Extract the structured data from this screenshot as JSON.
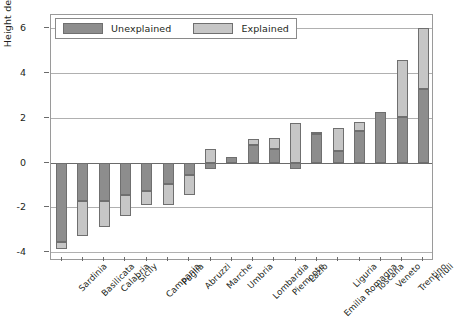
{
  "chart_data": {
    "type": "bar",
    "title": "",
    "xlabel": "",
    "ylabel": "Height deviation (cm)",
    "ylim": [
      -4.4,
      6.6
    ],
    "yticks": [
      6,
      4,
      2,
      0,
      -2,
      -4
    ],
    "ytick_labels": [
      "6",
      "4",
      "2",
      "0",
      "-2",
      "-4"
    ],
    "grid": true,
    "stacked": true,
    "legend_position": "top-left",
    "categories": [
      "Sardinia",
      "Basilicata",
      "Calabria",
      "Sicily",
      "Campania",
      "Puglia",
      "Abruzzi",
      "Marche",
      "Umbria",
      "Lombardia",
      "Piemonte",
      "Lazio",
      "Emilia Romagna",
      "Liguria",
      "Toscana",
      "Veneto",
      "Trentino",
      "Friuli"
    ],
    "series": [
      {
        "name": "Unexplained",
        "color": "#8d8d8d",
        "values": [
          -3.55,
          -1.7,
          -1.7,
          -1.45,
          -1.25,
          -0.95,
          -0.55,
          -0.3,
          0.25,
          0.8,
          0.6,
          -0.3,
          1.3,
          0.5,
          1.4,
          2.25,
          2.05,
          3.3
        ]
      },
      {
        "name": "Explained",
        "color": "#c6c6c6",
        "values": [
          -0.3,
          -1.6,
          -1.2,
          -0.95,
          -0.65,
          -0.95,
          -0.9,
          0.6,
          0.0,
          0.25,
          0.5,
          1.75,
          0.05,
          1.05,
          0.4,
          0.0,
          2.55,
          2.7
        ]
      }
    ],
    "totals": [
      -3.85,
      -3.3,
      -2.9,
      -2.4,
      -1.9,
      -1.9,
      -1.45,
      0.3,
      0.25,
      1.05,
      1.1,
      1.45,
      1.35,
      1.55,
      1.8,
      2.25,
      4.6,
      6.0
    ]
  },
  "legend": {
    "items": [
      {
        "label": "Unexplained",
        "swatch": "unexplained-swatch"
      },
      {
        "label": "Explained",
        "swatch": "explained-swatch"
      }
    ]
  },
  "caption": {
    "text": ""
  }
}
